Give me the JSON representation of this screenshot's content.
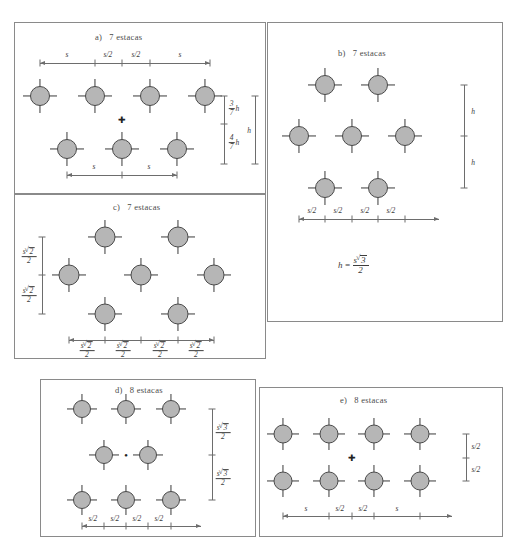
{
  "figure": {
    "type": "pile-group-layout-diagram",
    "language": "pt-BR",
    "term": "estacas",
    "panels": [
      {
        "id": "a",
        "lead": "a)",
        "title": "7 estacas",
        "pile_count": 7,
        "arrangement": "4 piles in top row, 3 piles in bottom row (staggered)",
        "top_dimensions": [
          "s",
          "s/2",
          "s/2",
          "s"
        ],
        "bottom_dimensions": [
          "s",
          "s"
        ],
        "right_dimensions": [
          "3/7 h",
          "4/7 h",
          "h"
        ],
        "right_fractions": [
          {
            "num": "3",
            "den": "7",
            "symbol": "h"
          },
          {
            "num": "4",
            "den": "7",
            "symbol": "h"
          }
        ],
        "total_height_label": "h",
        "has_centroid_marker": true
      },
      {
        "id": "b",
        "lead": "b)",
        "title": "7 estacas",
        "pile_count": 7,
        "arrangement": "2 piles top row, 3 piles middle row, 2 piles bottom row (triangular)",
        "bottom_dimensions": [
          "s/2",
          "s/2",
          "s/2",
          "s/2"
        ],
        "right_dimensions": [
          "h",
          "h"
        ],
        "formula": {
          "lhs": "h",
          "eq": "=",
          "num_s": "s",
          "num_root": "3",
          "den": "2"
        },
        "formula_text": "h = s√3 / 2",
        "has_centroid_marker": false
      },
      {
        "id": "c",
        "lead": "c)",
        "title": "7 estacas",
        "pile_count": 7,
        "arrangement": "2 piles top row, 3 piles middle row, 2 piles bottom row (staggered diagonal)",
        "bottom_dimensions": [
          "s√2/2",
          "s√2/2",
          "s√2/2",
          "s√2/2"
        ],
        "left_dimensions": [
          "s√2/2",
          "s√2/2"
        ],
        "fraction": {
          "num_s": "s",
          "num_root": "2",
          "den": "2"
        },
        "has_centroid_marker": false
      },
      {
        "id": "d",
        "lead": "d)",
        "title": "8 estacas",
        "pile_count": 8,
        "arrangement": "3 piles top row, 2 piles middle row, 3 piles bottom row",
        "bottom_dimensions": [
          "s/2",
          "s/2",
          "s/2",
          "s/2"
        ],
        "right_dimensions": [
          "s√3/2",
          "s√3/2"
        ],
        "fraction": {
          "num_s": "s",
          "num_root": "3",
          "den": "2"
        },
        "has_centroid_marker": true
      },
      {
        "id": "e",
        "lead": "e)",
        "title": "8 estacas",
        "pile_count": 8,
        "arrangement": "4 piles top row, 4 piles bottom row (rectangular grid)",
        "bottom_dimensions": [
          "s",
          "s/2",
          "s/2",
          "s"
        ],
        "right_dimensions": [
          "s/2",
          "s/2"
        ],
        "has_centroid_marker": true
      }
    ]
  },
  "colors": {
    "pile_fill": "#b6b6b6",
    "pile_stroke": "#4a4a4a",
    "dimension_line": "#6d6d6d",
    "panel_border": "#8a8a8a",
    "text": "#3a3a3a",
    "background": "#ffffff"
  }
}
